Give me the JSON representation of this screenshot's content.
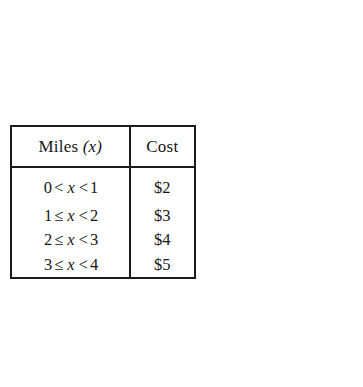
{
  "figure": {
    "table": {
      "headers": {
        "miles": "Miles",
        "miles_variable": "(x)",
        "cost": "Cost"
      },
      "rows": [
        {
          "lower": "0",
          "lower_op": "<",
          "variable": "x",
          "upper_op": "<",
          "upper": "1",
          "cost": "$2"
        },
        {
          "lower": "1",
          "lower_op": "≤",
          "variable": "x",
          "upper_op": "<",
          "upper": "2",
          "cost": "$3"
        },
        {
          "lower": "2",
          "lower_op": "≤",
          "variable": "x",
          "upper_op": "<",
          "upper": "3",
          "cost": "$4"
        },
        {
          "lower": "3",
          "lower_op": "≤",
          "variable": "x",
          "upper_op": "<",
          "upper": "4",
          "cost": "$5"
        }
      ]
    },
    "graph": {
      "y_axis_label": "Dollars",
      "clipped_glyph": "C"
    }
  },
  "colors": {
    "background": "#ffffff",
    "ink": "#1b1b1b",
    "tick": "#6f6f6f"
  }
}
